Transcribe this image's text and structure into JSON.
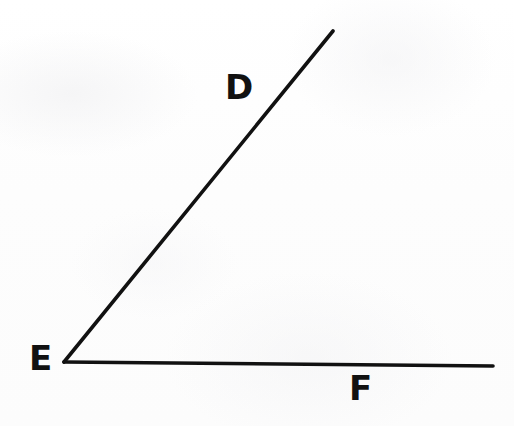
{
  "figure": {
    "kind": "geometry-angle-diagram",
    "background_color": "#fdfdfd",
    "ink_color": "#111111",
    "stroke_width_px": 3.6,
    "canvas": {
      "width": 514,
      "height": 426
    },
    "angle_name": "DEF",
    "vertex_point": "E"
  },
  "labels": {
    "ray_upper": "D",
    "vertex": "E",
    "ray_lower": "F"
  },
  "points": {
    "vertex_E": {
      "x": 64,
      "y": 362
    },
    "endpoint_D": {
      "x": 333,
      "y": 31
    },
    "endpoint_F": {
      "x": 493,
      "y": 366
    }
  },
  "label_positions": {
    "D": {
      "x": 238,
      "y": 91
    },
    "E": {
      "x": 42,
      "y": 361
    },
    "F": {
      "x": 362,
      "y": 391
    }
  },
  "segments": [
    {
      "name": "ray-ED",
      "from": "vertex_E",
      "to": "endpoint_D",
      "path": "M 64 362 L 333 31"
    },
    {
      "name": "ray-EF",
      "from": "vertex_E",
      "to": "endpoint_F",
      "path": "M 64 362 L 493 366"
    }
  ]
}
